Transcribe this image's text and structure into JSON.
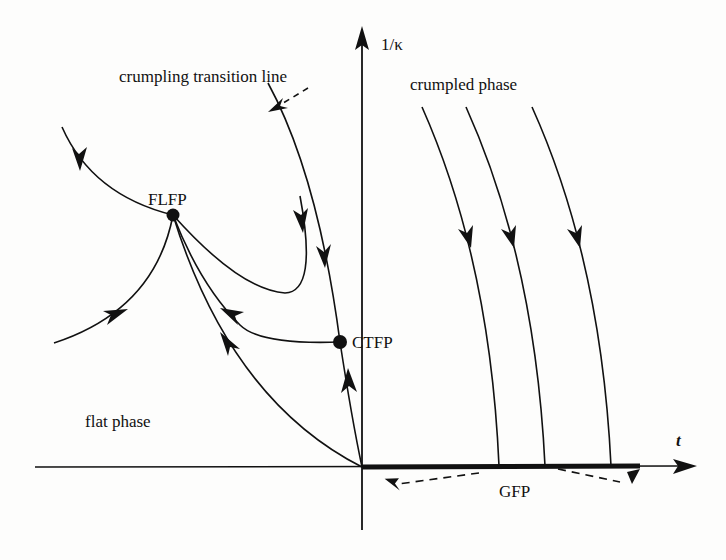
{
  "diagram": {
    "type": "renormalization-group flow diagram",
    "axes": {
      "vertical_label": "1/κ",
      "horizontal_label": "t"
    },
    "regions": {
      "crumpled": "crumpled phase",
      "flat": "flat phase"
    },
    "annotations": {
      "transition_line": "crumpling transition line",
      "gaussian_fixed_point": "GFP"
    },
    "fixed_points": [
      {
        "id": "flfp",
        "label": "FLFP"
      },
      {
        "id": "ctfp",
        "label": "CTFP"
      }
    ],
    "colors": {
      "ink": "#111111",
      "background": "#fdfdfc"
    }
  }
}
